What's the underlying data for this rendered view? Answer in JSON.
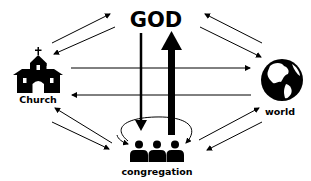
{
  "diagram": {
    "nodes": {
      "god": {
        "label": "GOD"
      },
      "church": {
        "label": "Church",
        "icon": "church-icon"
      },
      "world": {
        "label": "world",
        "icon": "globe-icon"
      },
      "congregation": {
        "label": "congregation",
        "icon": "people-icon"
      }
    },
    "edges": [
      {
        "from": "church",
        "to": "god"
      },
      {
        "from": "god",
        "to": "church"
      },
      {
        "from": "world",
        "to": "god"
      },
      {
        "from": "god",
        "to": "world"
      },
      {
        "from": "church",
        "to": "world"
      },
      {
        "from": "world",
        "to": "church"
      },
      {
        "from": "congregation",
        "to": "church"
      },
      {
        "from": "church",
        "to": "congregation"
      },
      {
        "from": "congregation",
        "to": "world"
      },
      {
        "from": "world",
        "to": "congregation"
      },
      {
        "from": "god",
        "to": "congregation",
        "style": "thin-vertical"
      },
      {
        "from": "congregation",
        "to": "god",
        "style": "thick-vertical"
      },
      {
        "from": "congregation",
        "to": "congregation",
        "style": "loop"
      }
    ],
    "colors": {
      "ink": "#000000",
      "background": "#ffffff"
    }
  }
}
